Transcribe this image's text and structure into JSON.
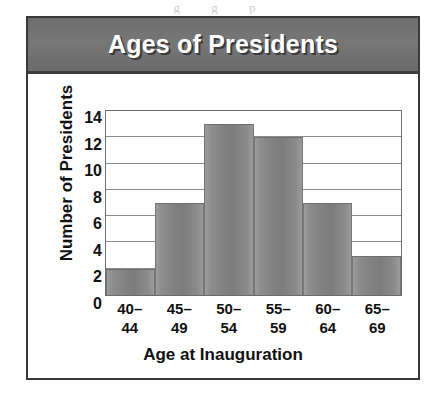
{
  "figure": {
    "title": "Ages of Presidents",
    "scan_artifact": "g g p"
  },
  "chart_data": {
    "type": "bar",
    "title": "Ages of Presidents",
    "xlabel": "Age at Inauguration",
    "ylabel": "Number of Presidents",
    "categories": [
      "40–44",
      "45–49",
      "50–54",
      "55–59",
      "60–64",
      "65–69"
    ],
    "category_lines": [
      [
        "40–",
        "44"
      ],
      [
        "45–",
        "49"
      ],
      [
        "50–",
        "54"
      ],
      [
        "55–",
        "59"
      ],
      [
        "60–",
        "64"
      ],
      [
        "65–",
        "69"
      ]
    ],
    "values": [
      2,
      7,
      13,
      12,
      7,
      3
    ],
    "ylim": [
      0,
      14
    ],
    "ytick_values": [
      0,
      2,
      4,
      6,
      8,
      10,
      12,
      14
    ],
    "ytick_labels": [
      "0",
      "2",
      "4",
      "6",
      "8",
      "10",
      "12",
      "14"
    ],
    "gridlines": [
      2,
      4,
      6,
      8,
      10,
      12
    ],
    "grid": true,
    "legend": null,
    "bar_gap": 0,
    "colors": {
      "bar_fill": "#848484",
      "bar_edge": "#6f6f6f",
      "banner_bg": "#707070",
      "banner_text": "#ffffff",
      "frame": "#3a3a3a",
      "gridline": "#8c8c8c",
      "text": "#111111",
      "plot_bg": "#ffffff"
    }
  }
}
